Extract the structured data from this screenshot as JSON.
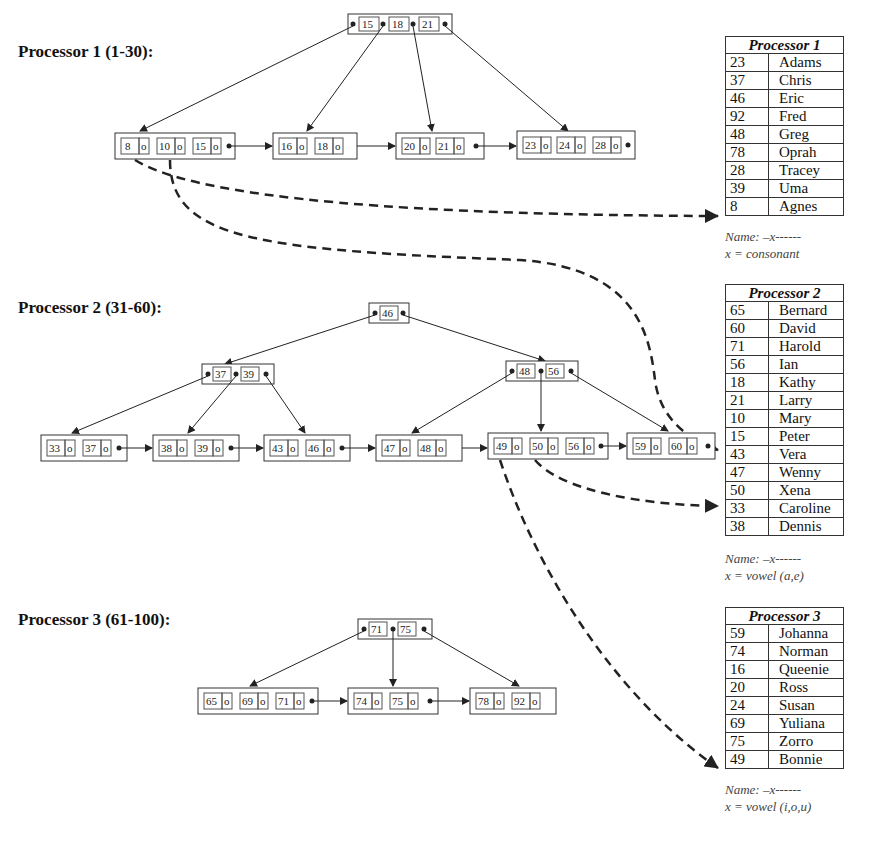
{
  "titles": {
    "p1": "Processor 1 (1-30):",
    "p2": "Processor 2 (31-60):",
    "p3": "Processor 3 (61-100):"
  },
  "trees": {
    "p1": {
      "root": [
        "15",
        "18",
        "21"
      ],
      "leaves": [
        [
          "8",
          "10",
          "15"
        ],
        [
          "16",
          "18"
        ],
        [
          "20",
          "21"
        ],
        [
          "23",
          "24",
          "28"
        ]
      ]
    },
    "p2": {
      "root": [
        "46"
      ],
      "internal": [
        [
          "37",
          "39"
        ],
        [
          "48",
          "56"
        ]
      ],
      "leaves": [
        [
          "33",
          "37"
        ],
        [
          "38",
          "39"
        ],
        [
          "43",
          "46"
        ],
        [
          "47",
          "48"
        ],
        [
          "49",
          "50",
          "56"
        ],
        [
          "59",
          "60"
        ]
      ]
    },
    "p3": {
      "root": [
        "71",
        "75"
      ],
      "leaves": [
        [
          "65",
          "69",
          "71"
        ],
        [
          "74",
          "75"
        ],
        [
          "78",
          "92"
        ]
      ]
    }
  },
  "tables": {
    "p1": {
      "header": "Processor 1",
      "rows": [
        {
          "id": "23",
          "name": "Adams"
        },
        {
          "id": "37",
          "name": "Chris"
        },
        {
          "id": "46",
          "name": "Eric"
        },
        {
          "id": "92",
          "name": "Fred"
        },
        {
          "id": "48",
          "name": "Greg"
        },
        {
          "id": "78",
          "name": "Oprah"
        },
        {
          "id": "28",
          "name": "Tracey"
        },
        {
          "id": "39",
          "name": "Uma"
        },
        {
          "id": "8",
          "name": "Agnes"
        }
      ],
      "note_line1": "Name: –x------",
      "note_line2": "x = consonant"
    },
    "p2": {
      "header": "Processor 2",
      "rows": [
        {
          "id": "65",
          "name": "Bernard"
        },
        {
          "id": "60",
          "name": "David"
        },
        {
          "id": "71",
          "name": "Harold"
        },
        {
          "id": "56",
          "name": "Ian"
        },
        {
          "id": "18",
          "name": "Kathy"
        },
        {
          "id": "21",
          "name": "Larry"
        },
        {
          "id": "10",
          "name": "Mary"
        },
        {
          "id": "15",
          "name": "Peter"
        },
        {
          "id": "43",
          "name": "Vera"
        },
        {
          "id": "47",
          "name": "Wenny"
        },
        {
          "id": "50",
          "name": "Xena"
        },
        {
          "id": "33",
          "name": "Caroline"
        },
        {
          "id": "38",
          "name": "Dennis"
        }
      ],
      "note_line1": "Name: –x------",
      "note_line2": "x = vowel (a,e)"
    },
    "p3": {
      "header": "Processor 3",
      "rows": [
        {
          "id": "59",
          "name": "Johanna"
        },
        {
          "id": "74",
          "name": "Norman"
        },
        {
          "id": "16",
          "name": "Queenie"
        },
        {
          "id": "20",
          "name": "Ross"
        },
        {
          "id": "24",
          "name": "Susan"
        },
        {
          "id": "69",
          "name": "Yuliana"
        },
        {
          "id": "75",
          "name": "Zorro"
        },
        {
          "id": "49",
          "name": "Bonnie"
        }
      ],
      "note_line1": "Name: –x------",
      "note_line2": "x = vowel (i,o,u)"
    }
  },
  "colors": {
    "line": "#222222",
    "box": "#333333",
    "text": "#111111"
  }
}
